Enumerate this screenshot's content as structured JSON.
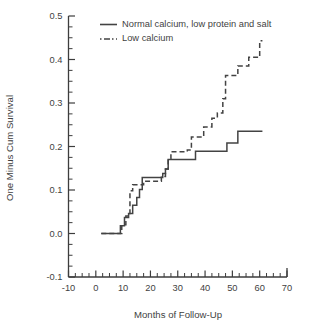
{
  "chart_data": {
    "type": "line",
    "title": "",
    "xlabel": "Months of Follow-Up",
    "ylabel": "One Minus Cum Survival",
    "xlim": [
      -10,
      70
    ],
    "ylim": [
      -0.1,
      0.5
    ],
    "grid": false,
    "legend_position": "top-center",
    "xticks": [
      -10,
      0,
      10,
      20,
      30,
      40,
      50,
      60,
      70
    ],
    "xticklabels": [
      "-10",
      "0",
      "10",
      "20",
      "30",
      "40",
      "50",
      "60",
      "70"
    ],
    "yticks": [
      -0.1,
      0.0,
      0.1,
      0.2,
      0.3,
      0.4,
      0.5
    ],
    "yticklabels": [
      "-0.1",
      "0.0",
      "0.1",
      "0.2",
      "0.3",
      "0.4",
      "0.5"
    ],
    "x_minor_tick_step": 2.5,
    "y_minor_tick_step": 0.025,
    "series": [
      {
        "name": "Normal calcium, low protein and salt",
        "style": "solid",
        "color": "#434343",
        "points": [
          [
            2.0,
            0.0
          ],
          [
            9.0,
            0.0
          ],
          [
            9.0,
            0.018
          ],
          [
            10.5,
            0.018
          ],
          [
            10.5,
            0.037
          ],
          [
            12.0,
            0.037
          ],
          [
            12.0,
            0.046
          ],
          [
            13.5,
            0.046
          ],
          [
            13.5,
            0.065
          ],
          [
            15.0,
            0.065
          ],
          [
            15.0,
            0.083
          ],
          [
            16.0,
            0.083
          ],
          [
            16.0,
            0.101
          ],
          [
            17.0,
            0.101
          ],
          [
            17.0,
            0.129
          ],
          [
            24.5,
            0.129
          ],
          [
            24.5,
            0.138
          ],
          [
            25.5,
            0.138
          ],
          [
            25.5,
            0.148
          ],
          [
            26.5,
            0.148
          ],
          [
            26.5,
            0.17
          ],
          [
            36.5,
            0.17
          ],
          [
            36.5,
            0.189
          ],
          [
            48.0,
            0.189
          ],
          [
            48.0,
            0.208
          ],
          [
            52.0,
            0.208
          ],
          [
            52.0,
            0.235
          ],
          [
            61.0,
            0.235
          ]
        ]
      },
      {
        "name": "Low calcium",
        "style": "dashed",
        "color": "#434343",
        "points": [
          [
            2.0,
            0.0
          ],
          [
            9.5,
            0.0
          ],
          [
            9.5,
            0.02
          ],
          [
            11.0,
            0.02
          ],
          [
            11.0,
            0.04
          ],
          [
            12.5,
            0.04
          ],
          [
            12.5,
            0.098
          ],
          [
            13.5,
            0.098
          ],
          [
            13.5,
            0.112
          ],
          [
            17.5,
            0.112
          ],
          [
            17.5,
            0.12
          ],
          [
            24.0,
            0.12
          ],
          [
            24.0,
            0.131
          ],
          [
            25.5,
            0.131
          ],
          [
            25.5,
            0.148
          ],
          [
            26.5,
            0.148
          ],
          [
            26.5,
            0.172
          ],
          [
            27.5,
            0.172
          ],
          [
            27.5,
            0.188
          ],
          [
            33.5,
            0.188
          ],
          [
            33.5,
            0.192
          ],
          [
            35.0,
            0.192
          ],
          [
            35.0,
            0.222
          ],
          [
            39.5,
            0.222
          ],
          [
            39.5,
            0.245
          ],
          [
            42.5,
            0.245
          ],
          [
            42.5,
            0.265
          ],
          [
            44.5,
            0.265
          ],
          [
            44.5,
            0.277
          ],
          [
            46.5,
            0.277
          ],
          [
            46.5,
            0.31
          ],
          [
            47.5,
            0.31
          ],
          [
            47.5,
            0.363
          ],
          [
            52.0,
            0.363
          ],
          [
            52.0,
            0.385
          ],
          [
            56.0,
            0.385
          ],
          [
            56.0,
            0.405
          ],
          [
            60.0,
            0.405
          ],
          [
            60.0,
            0.443
          ],
          [
            61.0,
            0.443
          ]
        ]
      }
    ],
    "legend": [
      {
        "label": "Normal calcium, low protein and salt",
        "style": "solid"
      },
      {
        "label": "Low calcium",
        "style": "dashed"
      }
    ]
  }
}
